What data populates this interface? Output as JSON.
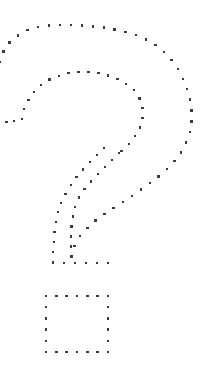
{
  "canvas": {
    "width": 219,
    "height": 379,
    "background_color": "#ffffff"
  },
  "artwork": {
    "name": "dotted-question-mark",
    "description": "Question mark drawn as an outline of small dark square dots",
    "dot_color": "#3a3a3e",
    "dot_size_px": 2.4,
    "alt_text": "?",
    "strokes": [
      {
        "name": "outer-arc",
        "type": "polyline-dots",
        "dot_spacing_px": 11,
        "points": [
          [
            0,
            62
          ],
          [
            4,
            50
          ],
          [
            11,
            41
          ],
          [
            20,
            34
          ],
          [
            31,
            29
          ],
          [
            44,
            26
          ],
          [
            58,
            25
          ],
          [
            72,
            25
          ],
          [
            86,
            26
          ],
          [
            100,
            27
          ],
          [
            113,
            29
          ],
          [
            126,
            32
          ],
          [
            138,
            36
          ],
          [
            149,
            41
          ],
          [
            159,
            48
          ],
          [
            168,
            56
          ],
          [
            176,
            66
          ],
          [
            182,
            77
          ],
          [
            187,
            89
          ],
          [
            190,
            101
          ],
          [
            192,
            114
          ],
          [
            191,
            126
          ],
          [
            188,
            138
          ],
          [
            183,
            149
          ],
          [
            176,
            159
          ],
          [
            168,
            168
          ],
          [
            158,
            177
          ],
          [
            147,
            185
          ],
          [
            136,
            193
          ],
          [
            124,
            201
          ],
          [
            112,
            209
          ],
          [
            100,
            217
          ],
          [
            90,
            226
          ],
          [
            81,
            235
          ],
          [
            75,
            245
          ],
          [
            72,
            255
          ],
          [
            71,
            263
          ]
        ]
      },
      {
        "name": "inner-arc",
        "type": "polyline-dots",
        "dot_spacing_px": 10,
        "points": [
          [
            22,
            119
          ],
          [
            24,
            110
          ],
          [
            28,
            101
          ],
          [
            33,
            93
          ],
          [
            40,
            86
          ],
          [
            49,
            80
          ],
          [
            59,
            76
          ],
          [
            70,
            73
          ],
          [
            81,
            72
          ],
          [
            92,
            72
          ],
          [
            103,
            74
          ],
          [
            113,
            77
          ],
          [
            122,
            81
          ],
          [
            130,
            87
          ],
          [
            137,
            94
          ],
          [
            141,
            103
          ],
          [
            143,
            112
          ],
          [
            142,
            121
          ],
          [
            139,
            130
          ],
          [
            134,
            138
          ],
          [
            127,
            146
          ],
          [
            119,
            153
          ]
        ]
      },
      {
        "name": "inner-arc-terminal",
        "type": "polyline-dots",
        "dot_spacing_px": 8,
        "points": [
          [
            22,
            119
          ],
          [
            14,
            121
          ],
          [
            6,
            122
          ]
        ]
      },
      {
        "name": "stem-right-diagonal",
        "type": "polyline-dots",
        "dot_spacing_px": 10,
        "points": [
          [
            119,
            153
          ],
          [
            110,
            162
          ],
          [
            101,
            171
          ],
          [
            92,
            180
          ],
          [
            84,
            190
          ],
          [
            78,
            200
          ],
          [
            74,
            211
          ],
          [
            72,
            222
          ],
          [
            71,
            233
          ],
          [
            71,
            244
          ],
          [
            71,
            254
          ],
          [
            71,
            263
          ]
        ]
      },
      {
        "name": "stem-left-diagonal",
        "type": "polyline-dots",
        "dot_spacing_px": 10,
        "points": [
          [
            104,
            148
          ],
          [
            95,
            157
          ],
          [
            86,
            166
          ],
          [
            78,
            175
          ],
          [
            71,
            185
          ],
          [
            65,
            195
          ],
          [
            60,
            206
          ],
          [
            57,
            217
          ],
          [
            55,
            228
          ],
          [
            54,
            239
          ],
          [
            53,
            250
          ],
          [
            53,
            263
          ]
        ]
      },
      {
        "name": "stem-bottom",
        "type": "polyline-dots",
        "dot_spacing_px": 11,
        "points": [
          [
            53,
            263
          ],
          [
            64,
            263
          ],
          [
            75,
            263
          ],
          [
            86,
            263
          ],
          [
            97,
            263
          ],
          [
            108,
            263
          ]
        ]
      },
      {
        "name": "dot-square",
        "type": "rect-dots",
        "dot_spacing_px": 11,
        "rect": {
          "x": 46,
          "y": 296,
          "width": 62,
          "height": 56
        }
      }
    ]
  }
}
